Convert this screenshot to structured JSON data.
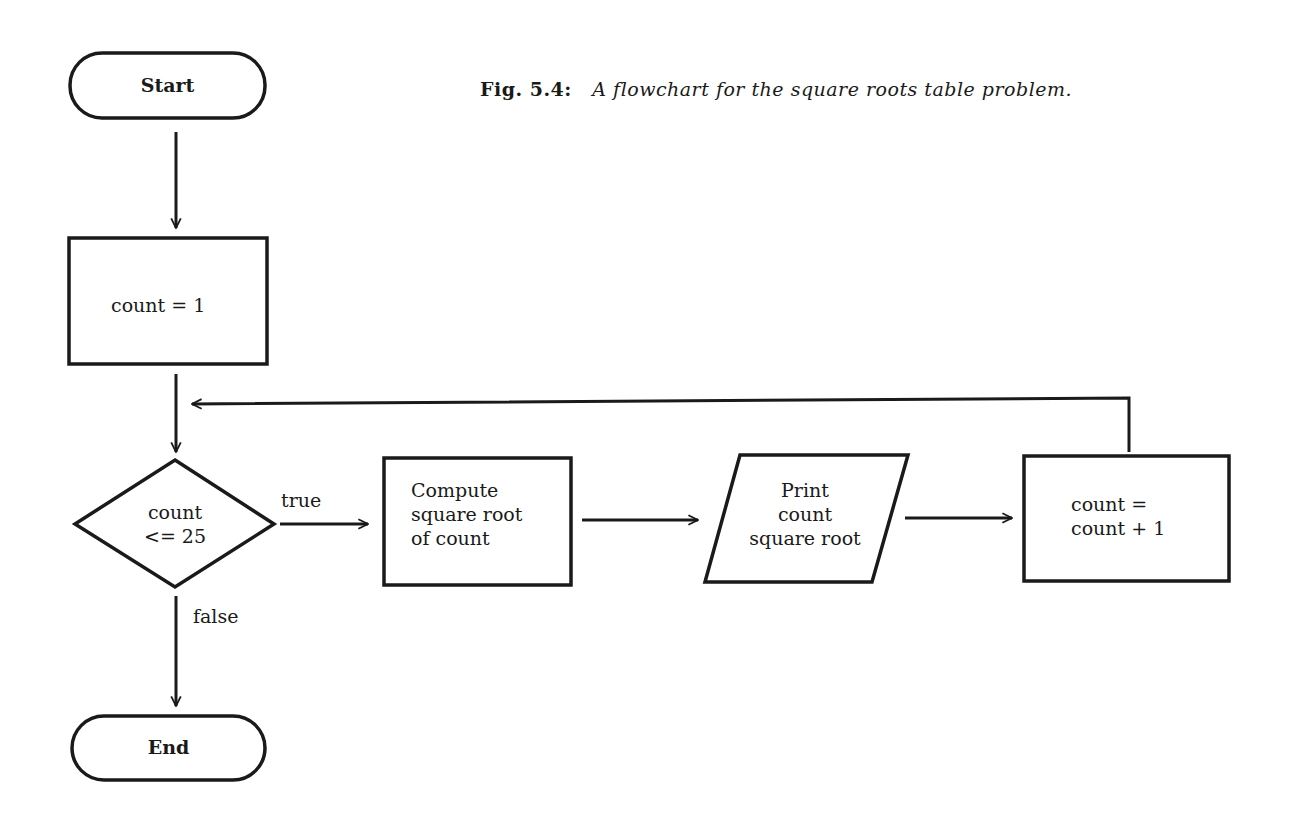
{
  "caption": {
    "number": "Fig. 5.4:",
    "text": "A flowchart for the square roots table problem."
  },
  "nodes": {
    "start": {
      "shape": "terminal",
      "label": "Start"
    },
    "init": {
      "shape": "process",
      "label": "count = 1"
    },
    "decision": {
      "shape": "decision",
      "line1": "count",
      "line2": "<= 25"
    },
    "compute": {
      "shape": "process",
      "line1": "Compute",
      "line2": "square root",
      "line3": "of count"
    },
    "print": {
      "shape": "input-output",
      "line1": "Print",
      "line2": "count",
      "line3": "square root"
    },
    "increment": {
      "shape": "process",
      "line1": "count =",
      "line2": "count + 1"
    },
    "end": {
      "shape": "terminal",
      "label": "End"
    }
  },
  "edges": {
    "true_label": "true",
    "false_label": "false"
  },
  "colors": {
    "stroke": "#1a1a1a",
    "background": "#ffffff"
  }
}
